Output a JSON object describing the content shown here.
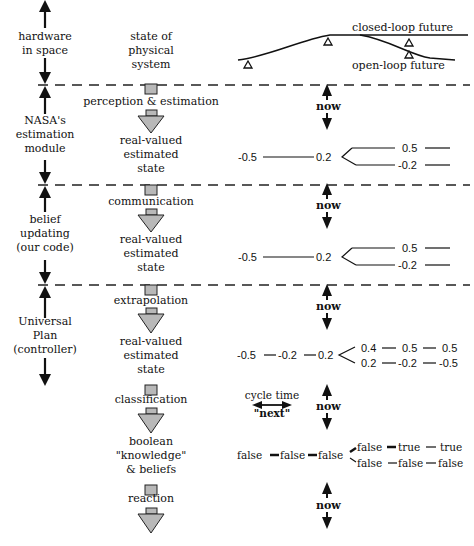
{
  "left_column": {
    "hardware": [
      "hardware",
      "in space"
    ],
    "nasa": [
      "NASA's",
      "estimation",
      "module"
    ],
    "belief": [
      "belief",
      "updating",
      "(our code)"
    ],
    "plan": [
      "Universal",
      "Plan",
      "(controller)"
    ]
  },
  "middle_column": {
    "physical_state": [
      "state of",
      "physical",
      "system"
    ],
    "step1": "perception & estimation",
    "state1": [
      "real-valued",
      "estimated",
      "state"
    ],
    "step2": "communication",
    "state2": [
      "real-valued",
      "estimated",
      "state"
    ],
    "step3": "extrapolation",
    "state3": [
      "real-valued",
      "estimated",
      "state"
    ],
    "step4": "classification",
    "beliefs": [
      "boolean",
      "\"knowledge\"",
      "& beliefs"
    ],
    "step5": "reaction"
  },
  "right_column": {
    "closed_loop": "closed-loop future",
    "open_loop": "open-loop future",
    "now_label": "now",
    "row1": {
      "past": "-0.5",
      "current": "0.2",
      "upper": "0.5",
      "lower": "-0.2"
    },
    "row2": {
      "past": "-0.5",
      "current": "0.2",
      "upper": "0.5",
      "lower": "-0.2"
    },
    "row3": {
      "past": [
        "-0.5",
        "-0.2",
        "0.2"
      ],
      "upper": [
        "0.4",
        "0.5",
        "0.5"
      ],
      "lower": [
        "0.2",
        "-0.2",
        "-0.5"
      ]
    },
    "cycle_time": "cycle time",
    "next": "\"next\"",
    "row4": {
      "past": [
        "false",
        "false",
        "false"
      ],
      "upper": [
        "false",
        "true",
        "true"
      ],
      "lower": [
        "false",
        "false",
        "false"
      ]
    }
  }
}
